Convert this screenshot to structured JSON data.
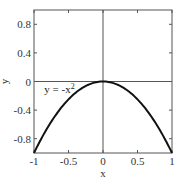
{
  "chart_data": {
    "type": "line",
    "title": "",
    "xlabel": "x",
    "ylabel": "y",
    "xlim": [
      -1,
      1
    ],
    "ylim": [
      -1,
      1
    ],
    "x_ticks": [
      -1,
      -0.5,
      0,
      0.5,
      1
    ],
    "x_tick_labels": [
      "-1",
      "-0.5",
      "0",
      "0.5",
      "1"
    ],
    "y_ticks": [
      -0.8,
      -0.4,
      0,
      0.4,
      0.8
    ],
    "y_tick_labels": [
      "-0.8",
      "-0.4",
      "0",
      "0.4",
      "0.8"
    ],
    "grid": false,
    "reference_lines": {
      "x": 0,
      "y": 0
    },
    "series": [
      {
        "name": "y = -x^2",
        "function": "-x^2",
        "x": [
          -1,
          -0.75,
          -0.5,
          -0.25,
          0,
          0.25,
          0.5,
          0.75,
          1
        ],
        "y": [
          -1,
          -0.5625,
          -0.25,
          -0.0625,
          0,
          -0.0625,
          -0.25,
          -0.5625,
          -1
        ],
        "color": "#111111"
      }
    ],
    "annotations": [
      {
        "text": "y = -x",
        "superscript": "2",
        "x": -0.85,
        "y": -0.1
      }
    ]
  }
}
